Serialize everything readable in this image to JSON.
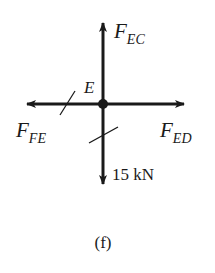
{
  "figure": {
    "caption": "(f)",
    "joint_label": "E",
    "forces": {
      "up": {
        "symbol": "F",
        "subscript": "EC",
        "direction": "up"
      },
      "left": {
        "symbol": "F",
        "subscript": "FE",
        "direction": "left"
      },
      "right": {
        "symbol": "F",
        "subscript": "ED",
        "direction": "right"
      },
      "down": {
        "label": "15 kN",
        "direction": "down"
      }
    },
    "colors": {
      "ink": "#1a1a1a",
      "background": "#ffffff"
    }
  }
}
